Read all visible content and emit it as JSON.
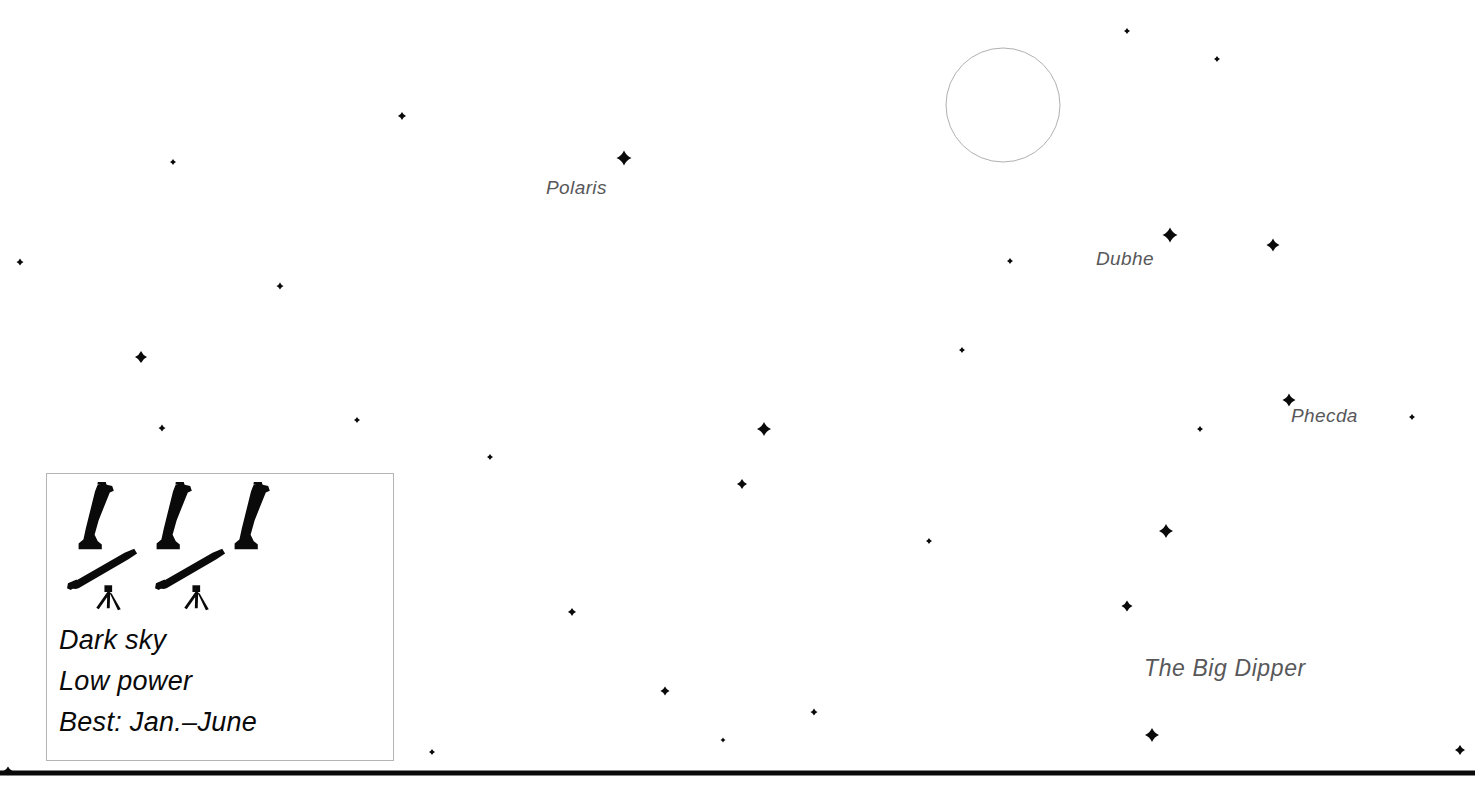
{
  "chart_data": {
    "type": "scatter",
    "title": "",
    "subtitle": "",
    "xlabel": "",
    "ylabel": "",
    "xlim": [
      0,
      1475
    ],
    "ylim": [
      0,
      800
    ],
    "grid": false,
    "legend_position": "bottom-left",
    "background_color": "#ffffff",
    "star_color": "#0a0a0a",
    "label_color": "#58585a",
    "horizon_color": "#0a0a0a",
    "moon_outline_color": "#b0b0b0",
    "named_stars": [
      {
        "name": "Polaris",
        "x": 624,
        "y": 158,
        "size": 15,
        "label_x": 546,
        "label_y": 178
      },
      {
        "name": "Dubhe",
        "x": 1170,
        "y": 235,
        "size": 15,
        "label_x": 1096,
        "label_y": 249
      },
      {
        "name": "Phecda",
        "x": 1289,
        "y": 400,
        "size": 13,
        "label_x": 1291,
        "label_y": 406
      }
    ],
    "constellations": [
      {
        "name": "The Big Dipper",
        "label_x": 1144,
        "label_y": 657
      }
    ],
    "stars": [
      {
        "x": 624,
        "y": 158,
        "size": 15
      },
      {
        "x": 1170,
        "y": 235,
        "size": 15
      },
      {
        "x": 1273,
        "y": 245,
        "size": 13
      },
      {
        "x": 1289,
        "y": 400,
        "size": 13
      },
      {
        "x": 1166,
        "y": 531,
        "size": 14
      },
      {
        "x": 1127,
        "y": 606,
        "size": 11
      },
      {
        "x": 1152,
        "y": 735,
        "size": 14
      },
      {
        "x": 764,
        "y": 429,
        "size": 14
      },
      {
        "x": 742,
        "y": 484,
        "size": 10
      },
      {
        "x": 141,
        "y": 357,
        "size": 12
      },
      {
        "x": 402,
        "y": 116,
        "size": 8
      },
      {
        "x": 173,
        "y": 162,
        "size": 6
      },
      {
        "x": 20,
        "y": 262,
        "size": 7
      },
      {
        "x": 280,
        "y": 286,
        "size": 7
      },
      {
        "x": 162,
        "y": 428,
        "size": 7
      },
      {
        "x": 357,
        "y": 420,
        "size": 6
      },
      {
        "x": 490,
        "y": 457,
        "size": 6
      },
      {
        "x": 572,
        "y": 612,
        "size": 8
      },
      {
        "x": 665,
        "y": 691,
        "size": 9
      },
      {
        "x": 814,
        "y": 712,
        "size": 7
      },
      {
        "x": 723,
        "y": 740,
        "size": 5
      },
      {
        "x": 929,
        "y": 541,
        "size": 6
      },
      {
        "x": 962,
        "y": 350,
        "size": 6
      },
      {
        "x": 1010,
        "y": 261,
        "size": 6
      },
      {
        "x": 1127,
        "y": 31,
        "size": 6
      },
      {
        "x": 1217,
        "y": 59,
        "size": 6
      },
      {
        "x": 1200,
        "y": 429,
        "size": 6
      },
      {
        "x": 1412,
        "y": 417,
        "size": 6
      },
      {
        "x": 1460,
        "y": 750,
        "size": 10
      },
      {
        "x": 432,
        "y": 752,
        "size": 6
      },
      {
        "x": 8,
        "y": 771,
        "size": 9
      }
    ],
    "moon": {
      "x": 1003,
      "y": 105,
      "radius": 57,
      "filled": false
    },
    "horizon": {
      "y": 773,
      "thickness": 5,
      "x_start": 0,
      "x_end": 1475
    }
  },
  "legend": {
    "icon_rows": [
      {
        "row_name": "dark-sky-rating",
        "icon_name": "telescope-cannon-icon",
        "count": 3
      },
      {
        "row_name": "low-power-rating",
        "icon_name": "telescope-tripod-icon",
        "count": 2
      }
    ],
    "lines": [
      "Dark sky",
      "Low power",
      "Best: Jan.–June"
    ]
  }
}
